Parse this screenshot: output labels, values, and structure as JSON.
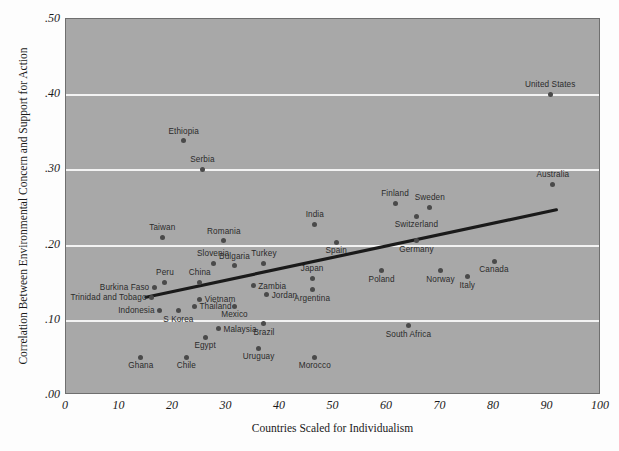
{
  "chart_data": {
    "type": "scatter",
    "title": "",
    "xlabel": "Countries Scaled for Individualism",
    "ylabel": "Correlation Between Environmental Concern and Support for Action",
    "xlim": [
      0,
      100
    ],
    "ylim": [
      0.0,
      0.5
    ],
    "xticks": [
      "0",
      "10",
      "20",
      "30",
      "40",
      "50",
      "60",
      "70",
      "80",
      "90",
      "100"
    ],
    "xtick_values": [
      0,
      10,
      20,
      30,
      40,
      50,
      60,
      70,
      80,
      90,
      100
    ],
    "yticks": [
      ".00",
      ".10",
      ".20",
      ".30",
      ".40",
      ".50"
    ],
    "ytick_values": [
      0.0,
      0.1,
      0.2,
      0.3,
      0.4,
      0.5
    ],
    "grid": "horizontal",
    "legend": "none",
    "colors": {
      "panel_background": "#a8a8a8",
      "gridline": "#f3f3f3",
      "point": "#4a4a4a",
      "trendline": "#1a1a1a",
      "text": "#1a1a1a",
      "figure_background": "#fdfdfd"
    },
    "trendline": {
      "type": "linear",
      "x_start": 15,
      "y_start": 0.128,
      "x_end": 92,
      "y_end": 0.245
    },
    "points": [
      {
        "label": "United States",
        "x": 90.5,
        "y": 0.4,
        "label_pos": "above"
      },
      {
        "label": "Australia",
        "x": 91.0,
        "y": 0.28,
        "label_pos": "above"
      },
      {
        "label": "Ethiopia",
        "x": 22.0,
        "y": 0.338,
        "label_pos": "above"
      },
      {
        "label": "Serbia",
        "x": 25.5,
        "y": 0.3,
        "label_pos": "above"
      },
      {
        "label": "Finland",
        "x": 61.5,
        "y": 0.255,
        "label_pos": "above"
      },
      {
        "label": "Sweden",
        "x": 68.0,
        "y": 0.25,
        "label_pos": "above"
      },
      {
        "label": "Switzerland",
        "x": 65.5,
        "y": 0.238,
        "label_pos": "below"
      },
      {
        "label": "India",
        "x": 46.5,
        "y": 0.227,
        "label_pos": "above"
      },
      {
        "label": "Taiwan",
        "x": 18.0,
        "y": 0.21,
        "label_pos": "above"
      },
      {
        "label": "Romania",
        "x": 29.5,
        "y": 0.205,
        "label_pos": "above"
      },
      {
        "label": "Germany",
        "x": 65.5,
        "y": 0.205,
        "label_pos": "below"
      },
      {
        "label": "Spain",
        "x": 50.5,
        "y": 0.203,
        "label_pos": "below"
      },
      {
        "label": "Canada",
        "x": 80.0,
        "y": 0.178,
        "label_pos": "below"
      },
      {
        "label": "Turkey",
        "x": 37.0,
        "y": 0.175,
        "label_pos": "above"
      },
      {
        "label": "Slovenia",
        "x": 27.5,
        "y": 0.175,
        "label_pos": "above"
      },
      {
        "label": "Bulgaria",
        "x": 31.5,
        "y": 0.172,
        "label_pos": "above"
      },
      {
        "label": "Poland",
        "x": 59.0,
        "y": 0.165,
        "label_pos": "below"
      },
      {
        "label": "Norway",
        "x": 70.0,
        "y": 0.165,
        "label_pos": "below"
      },
      {
        "label": "Italy",
        "x": 75.0,
        "y": 0.157,
        "label_pos": "below"
      },
      {
        "label": "Japan",
        "x": 46.0,
        "y": 0.155,
        "label_pos": "above"
      },
      {
        "label": "Peru",
        "x": 18.5,
        "y": 0.15,
        "label_pos": "above"
      },
      {
        "label": "China",
        "x": 25.0,
        "y": 0.15,
        "label_pos": "above"
      },
      {
        "label": "Burkina Faso",
        "x": 16.5,
        "y": 0.143,
        "label_pos": "left"
      },
      {
        "label": "Zambia",
        "x": 35.0,
        "y": 0.145,
        "label_pos": "right"
      },
      {
        "label": "Argentina",
        "x": 46.0,
        "y": 0.14,
        "label_pos": "below"
      },
      {
        "label": "Jordan",
        "x": 37.5,
        "y": 0.133,
        "label_pos": "right"
      },
      {
        "label": "Trinidad and Tobago",
        "x": 16.0,
        "y": 0.13,
        "label_pos": "left"
      },
      {
        "label": "Vietnam",
        "x": 25.0,
        "y": 0.127,
        "label_pos": "right"
      },
      {
        "label": "Thailand",
        "x": 24.0,
        "y": 0.118,
        "label_pos": "right"
      },
      {
        "label": "Mexico",
        "x": 31.5,
        "y": 0.118,
        "label_pos": "below"
      },
      {
        "label": "Indonesia",
        "x": 17.5,
        "y": 0.113,
        "label_pos": "left"
      },
      {
        "label": "S Korea",
        "x": 21.0,
        "y": 0.112,
        "label_pos": "below"
      },
      {
        "label": "Brazil",
        "x": 37.0,
        "y": 0.095,
        "label_pos": "below"
      },
      {
        "label": "South Africa",
        "x": 64.0,
        "y": 0.092,
        "label_pos": "below"
      },
      {
        "label": "Malaysia",
        "x": 28.5,
        "y": 0.088,
        "label_pos": "right"
      },
      {
        "label": "Egypt",
        "x": 26.0,
        "y": 0.077,
        "label_pos": "below"
      },
      {
        "label": "Uruguay",
        "x": 36.0,
        "y": 0.062,
        "label_pos": "below"
      },
      {
        "label": "Ghana",
        "x": 14.0,
        "y": 0.05,
        "label_pos": "below"
      },
      {
        "label": "Chile",
        "x": 22.5,
        "y": 0.05,
        "label_pos": "below"
      },
      {
        "label": "Morocco",
        "x": 46.5,
        "y": 0.05,
        "label_pos": "below"
      }
    ]
  }
}
